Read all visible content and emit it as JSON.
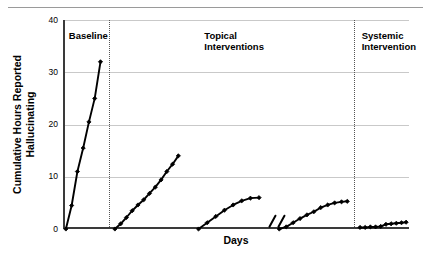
{
  "chart_data": {
    "type": "line",
    "title": "",
    "xlabel": "Days",
    "ylabel": "Cumulative Hours Reported Hallucinating",
    "ylabel_line1": "Cumulative Hours Reported",
    "ylabel_line2": "Hallucinating",
    "ylim": [
      0,
      40
    ],
    "yticks": [
      0,
      10,
      20,
      30,
      40
    ],
    "ytick_labels": [
      "0",
      "10",
      "20",
      "30",
      "40"
    ],
    "xlim": [
      0,
      60
    ],
    "xticks_shown": false,
    "grid": "horizontal",
    "legend": "none",
    "marker": "diamond",
    "line_color": "#000000",
    "gridline_color": "#c9c9c9",
    "axis_color": "#3a3a3a",
    "phase_dividers_x": [
      8.0,
      50.5
    ],
    "phases": [
      {
        "name": "baseline",
        "label_line1": "Baseline",
        "label_line2": "",
        "label_x": 1.0,
        "label_y": 37.0,
        "x_start": 0.0,
        "x_end": 8.0
      },
      {
        "name": "topical-interventions",
        "label_line1": "Topical",
        "label_line2": "Interventions",
        "label_x": 24.5,
        "label_y": 37.0,
        "x_start": 8.0,
        "x_end": 50.5
      },
      {
        "name": "systemic-intervention",
        "label_line1": "Systemic",
        "label_line2": "Intervention",
        "label_x": 51.8,
        "label_y": 37.0,
        "x_start": 50.5,
        "x_end": 60.0
      }
    ],
    "series": [
      {
        "name": "Baseline",
        "phase": "baseline",
        "x": [
          0.5,
          1.5,
          2.5,
          3.5,
          4.5,
          5.5,
          6.5
        ],
        "values": [
          0,
          4.5,
          11,
          15.5,
          20.5,
          25,
          32
        ]
      },
      {
        "name": "Topical Intervention 1",
        "phase": "topical-interventions",
        "x": [
          9.0,
          10.0,
          11.0,
          12.0,
          13.0,
          14.0,
          15.0,
          16.0,
          17.0,
          18.0,
          19.0,
          20.0
        ],
        "values": [
          0,
          1.0,
          2.2,
          3.5,
          4.6,
          5.6,
          6.8,
          8.0,
          9.4,
          11.0,
          12.4,
          14.0
        ]
      },
      {
        "name": "Topical Intervention 2",
        "phase": "topical-interventions",
        "x": [
          23.5,
          25.0,
          26.5,
          28.0,
          29.5,
          31.0,
          32.5,
          34.0
        ],
        "values": [
          0,
          1.2,
          2.4,
          3.6,
          4.6,
          5.4,
          5.9,
          6.0
        ]
      },
      {
        "name": "Topical Intervention 3",
        "phase": "topical-interventions",
        "x": [
          37.5,
          38.7,
          39.9,
          41.1,
          42.3,
          43.5,
          44.7,
          45.9,
          47.1,
          48.3,
          49.3
        ],
        "values": [
          0,
          0.4,
          1.2,
          2.0,
          2.7,
          3.3,
          4.1,
          4.6,
          5.0,
          5.2,
          5.3
        ]
      },
      {
        "name": "Systemic Intervention",
        "phase": "systemic-intervention",
        "x": [
          51.5,
          52.4,
          53.3,
          54.2,
          55.1,
          56.0,
          56.9,
          57.8,
          58.7,
          59.5
        ],
        "values": [
          0.3,
          0.3,
          0.4,
          0.4,
          0.5,
          0.9,
          1.0,
          1.1,
          1.2,
          1.3
        ]
      }
    ],
    "annotations": [
      {
        "name": "axis-break-slashes",
        "type": "double-slash",
        "x": 35.8,
        "y": 1.4,
        "count": 2
      }
    ]
  }
}
